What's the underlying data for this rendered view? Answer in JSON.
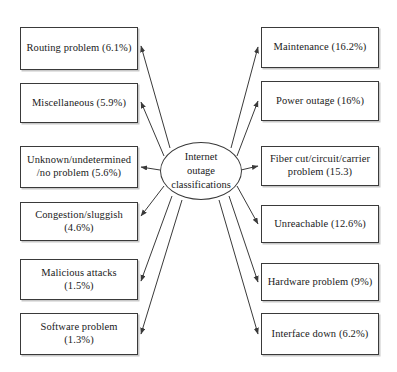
{
  "diagram": {
    "type": "hub-and-spoke",
    "title": "Internet outage classifications",
    "background_color": "#ffffff",
    "node_border_color": "#3a3a3a",
    "node_fill_color": "#ffffff",
    "edge_color": "#3a3a3a",
    "center": {
      "label": "Internet\noutage\nclassifications",
      "shape": "ellipse"
    },
    "left_nodes": [
      {
        "label": "Routing problem (6.1%)",
        "value": 6.1
      },
      {
        "label": "Miscellaneous (5.9%)",
        "value": 5.9
      },
      {
        "label": "Unknown/undetermined\n/no problem (5.6%)",
        "value": 5.6
      },
      {
        "label": "Congestion/sluggish\n(4.6%)",
        "value": 4.6
      },
      {
        "label": "Malicious attacks\n(1.5%)",
        "value": 1.5
      },
      {
        "label": "Software problem\n(1.3%)",
        "value": 1.3
      }
    ],
    "right_nodes": [
      {
        "label": "Maintenance (16.2%)",
        "value": 16.2
      },
      {
        "label": "Power outage (16%)",
        "value": 16
      },
      {
        "label": "Fiber cut/circuit/carrier\nproblem (15.3)",
        "value": 15.3
      },
      {
        "label": "Unreachable (12.6%)",
        "value": 12.6
      },
      {
        "label": "Hardware problem (9%)",
        "value": 9
      },
      {
        "label": "Interface down (6.2%)",
        "value": 6.2
      }
    ]
  }
}
